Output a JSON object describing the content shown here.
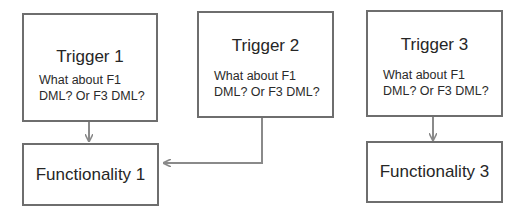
{
  "diagram": {
    "triggers": [
      {
        "title": "Trigger 1",
        "note_line1": "What about F1",
        "note_line2": "DML? Or  F3 DML?"
      },
      {
        "title": "Trigger 2",
        "note_line1": "What about F1",
        "note_line2": "DML? Or  F3 DML?"
      },
      {
        "title": "Trigger 3",
        "note_line1": "What about F1",
        "note_line2": "DML? Or  F3 DML?"
      }
    ],
    "functionalities": [
      {
        "label": "Functionality 1"
      },
      {
        "label": "Functionality 3"
      }
    ],
    "edges": [
      {
        "from": "Trigger 1",
        "to": "Functionality 1"
      },
      {
        "from": "Trigger 2",
        "to": "Functionality 1"
      },
      {
        "from": "Trigger 3",
        "to": "Functionality 3"
      }
    ],
    "colors": {
      "border": "#6e6e6e",
      "arrow": "#8a8a8a"
    }
  }
}
